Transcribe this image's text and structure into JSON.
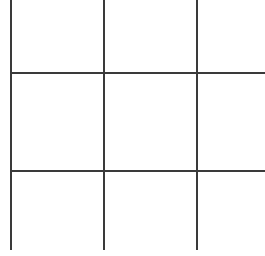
{
  "canvas": {
    "width": 265,
    "height": 256,
    "background_color": "#ffffff"
  },
  "grid": {
    "name": "tic-tac-toe-grid",
    "rows": 3,
    "columns": 3,
    "line_color": "#3a3a3a",
    "line_width": 2,
    "vertical_lines": [
      {
        "id": "vertical-line-1",
        "x": 11,
        "y_start": 0,
        "y_end": 250
      },
      {
        "id": "vertical-line-2",
        "x": 104,
        "y_start": 0,
        "y_end": 250
      },
      {
        "id": "vertical-line-3",
        "x": 197,
        "y_start": 0,
        "y_end": 250
      }
    ],
    "horizontal_lines": [
      {
        "id": "horizontal-line-1",
        "y": 73,
        "x_start": 11,
        "x_end": 265
      },
      {
        "id": "horizontal-line-2",
        "y": 171,
        "x_start": 11,
        "x_end": 265
      }
    ],
    "cells": [
      {
        "id": "cell-r1c1",
        "label": ""
      },
      {
        "id": "cell-r1c2",
        "label": ""
      },
      {
        "id": "cell-r1c3",
        "label": ""
      },
      {
        "id": "cell-r2c1",
        "label": ""
      },
      {
        "id": "cell-r2c2",
        "label": ""
      },
      {
        "id": "cell-r2c3",
        "label": ""
      },
      {
        "id": "cell-r3c1",
        "label": ""
      },
      {
        "id": "cell-r3c2",
        "label": ""
      },
      {
        "id": "cell-r3c3",
        "label": ""
      }
    ]
  }
}
